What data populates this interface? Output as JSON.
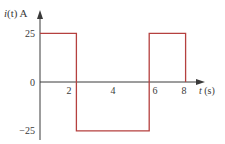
{
  "chart_data": {
    "type": "line",
    "title": "",
    "xlabel": "t (s)",
    "ylabel": "i(t) A",
    "xlabel_parts": {
      "var": "t",
      "unit": " (s)"
    },
    "ylabel_parts": {
      "var": "i",
      "arg": "(t)",
      "unit": " A"
    },
    "x_ticks": [
      2,
      4,
      6,
      8
    ],
    "x_tick_labels": [
      "2",
      "4",
      "6",
      "8"
    ],
    "y_ticks": [
      25,
      0,
      -25
    ],
    "y_tick_labels": [
      "25",
      "0",
      "−25"
    ],
    "xlim": [
      0,
      9
    ],
    "ylim": [
      -25,
      25
    ],
    "grid": false,
    "legend": null,
    "series": [
      {
        "name": "i(t)",
        "color": "#b5403f",
        "step": true,
        "points": [
          {
            "x": 0,
            "y": 25
          },
          {
            "x": 2,
            "y": 25
          },
          {
            "x": 2,
            "y": -25
          },
          {
            "x": 6,
            "y": -25
          },
          {
            "x": 6,
            "y": 25
          },
          {
            "x": 8,
            "y": 25
          },
          {
            "x": 8,
            "y": 0
          }
        ]
      }
    ]
  },
  "colors": {
    "axis": "#3a3a3a",
    "waveform": "#b5403f",
    "text": "#3a3a3a",
    "background": "#ffffff"
  }
}
